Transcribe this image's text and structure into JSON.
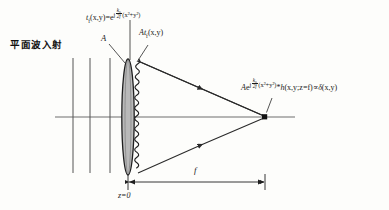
{
  "figure": {
    "kind": "optics-ray-diagram",
    "caption_cn": "平面波入射",
    "axis_color": "#6f6f6f",
    "ray_color": "#2a2a2a",
    "lens_fill": "#b9b9b9",
    "lens_stroke": "#1f1f1f",
    "wavefront_color": "#1f1f1f",
    "background": "#fdfdfb"
  },
  "labels": {
    "plane_wave_cn": "平面波入射",
    "amplitude": "A",
    "z_origin": "z=0",
    "focal_length": "f",
    "lens_transmittance": {
      "lhs": "t",
      "lhs_sub": "f",
      "lhs_args": "(x,y)",
      "equals": "=",
      "base": "e",
      "exp_j": "j",
      "exp_num": "k",
      "exp_num_sub": "0",
      "exp_den": "2f",
      "exp_tail": "(x²+y²)",
      "plain": "t_f(x,y)=e^{j(k0/2f)(x^2+y^2)}"
    },
    "field_after_lens": {
      "prefix": "At",
      "sub": "f",
      "args": "(x,y)",
      "plain": "At_f(x,y)"
    },
    "focal_field": {
      "amp": "A",
      "base": "e",
      "exp_j": "j",
      "exp_num": "k",
      "exp_num_sub": "0",
      "exp_den": "2f",
      "exp_tail": "(x²+y²)",
      "conv": "*",
      "h": "h",
      "h_args": "(x,y;z=f)",
      "prop": "∝",
      "delta": "δ",
      "delta_args": "(x,y)",
      "plain": "Ae^{j(k0/2f)(x^2+y^2)} * h(x,y;z=f) ∝ δ(x,y)"
    }
  },
  "geometry": {
    "optical_axis_y": 117,
    "lens_x": 128,
    "focal_point_x": 265,
    "focal_point_y": 117,
    "plane_wave_lines_x": [
      73,
      90,
      110
    ],
    "dimension_line_y": 182,
    "dimension_from_x": 128,
    "dimension_to_x": 265
  }
}
